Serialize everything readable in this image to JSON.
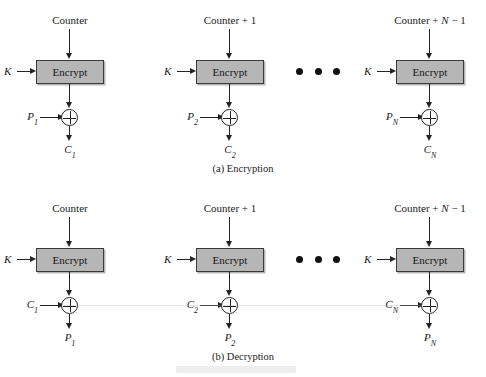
{
  "figure": {
    "panels": [
      {
        "id": "encryption",
        "caption": "(a) Encryption",
        "stages": [
          {
            "counter_label": "Counter",
            "counter_prefix": "Counter",
            "counter_suffix": "",
            "key_label": "K",
            "box_label": "Encrypt",
            "input_base": "P",
            "input_sub": "1",
            "output_base": "C",
            "output_sub": "1"
          },
          {
            "counter_label": "Counter + 1",
            "counter_prefix": "Counter + 1",
            "counter_suffix": "",
            "key_label": "K",
            "box_label": "Encrypt",
            "input_base": "P",
            "input_sub": "2",
            "output_base": "C",
            "output_sub": "2"
          },
          {
            "counter_label": "Counter + N − 1",
            "counter_prefix": "Counter + ",
            "counter_italic": "N",
            "counter_suffix": " − 1",
            "key_label": "K",
            "box_label": "Encrypt",
            "input_base": "P",
            "input_sub": "N",
            "output_base": "C",
            "output_sub": "N"
          }
        ]
      },
      {
        "id": "decryption",
        "caption": "(b) Decryption",
        "stages": [
          {
            "counter_label": "Counter",
            "counter_prefix": "Counter",
            "counter_suffix": "",
            "key_label": "K",
            "box_label": "Encrypt",
            "input_base": "C",
            "input_sub": "1",
            "output_base": "P",
            "output_sub": "1"
          },
          {
            "counter_label": "Counter + 1",
            "counter_prefix": "Counter + 1",
            "counter_suffix": "",
            "key_label": "K",
            "box_label": "Encrypt",
            "input_base": "C",
            "input_sub": "2",
            "output_base": "P",
            "output_sub": "2"
          },
          {
            "counter_label": "Counter + N − 1",
            "counter_prefix": "Counter + ",
            "counter_italic": "N",
            "counter_suffix": " − 1",
            "key_label": "K",
            "box_label": "Encrypt",
            "input_base": "C",
            "input_sub": "N",
            "output_base": "P",
            "output_sub": "N"
          }
        ]
      }
    ],
    "ellipsis": "• • •",
    "colors": {
      "box_fill": "#b6b6b6",
      "box_stroke": "#3a3a3a",
      "line": "#222222",
      "text": "#1c1c1c",
      "background": "#ffffff"
    }
  }
}
